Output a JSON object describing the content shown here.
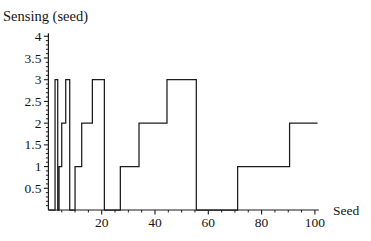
{
  "chart_data": {
    "type": "line",
    "subtype": "step-function",
    "title": "Sensing  (seed)",
    "xlabel": "Seed",
    "ylabel": "",
    "line_color": "#1c1c1c",
    "axis_color": "#1c1c1c",
    "background": "#ffffff",
    "grid": false,
    "legend": false,
    "x_axis": {
      "min": 0,
      "max": 101.5,
      "major_ticks": [
        20,
        40,
        60,
        80,
        100
      ],
      "major_labels": [
        "20",
        "40",
        "60",
        "80",
        "100"
      ],
      "minor_tick_step": 5
    },
    "y_axis": {
      "min": 0,
      "max": 4.07,
      "major_ticks": [
        0.5,
        1,
        1.5,
        2,
        2.5,
        3,
        3.5,
        4
      ],
      "major_labels": [
        "0.5",
        "1",
        "1.5",
        "2",
        "2.5",
        "3",
        "3.5",
        "4"
      ],
      "minor_tick_step": 0.1
    },
    "series": [
      {
        "name": "Sensing(seed)",
        "segments": [
          [
            0,
            2.5,
            0
          ],
          [
            2.5,
            3.5,
            3
          ],
          [
            3.5,
            4,
            0
          ],
          [
            4,
            5,
            1
          ],
          [
            5,
            6.5,
            2
          ],
          [
            6.5,
            8,
            3
          ],
          [
            8,
            10,
            0
          ],
          [
            10,
            12.5,
            1
          ],
          [
            12.5,
            16.5,
            2
          ],
          [
            16.5,
            21,
            3
          ],
          [
            21,
            27,
            0
          ],
          [
            27,
            34,
            1
          ],
          [
            34,
            44.5,
            2
          ],
          [
            44.5,
            55.5,
            3
          ],
          [
            55.5,
            71,
            0
          ],
          [
            71,
            90.5,
            1
          ],
          [
            90.5,
            101,
            2
          ]
        ]
      }
    ]
  }
}
